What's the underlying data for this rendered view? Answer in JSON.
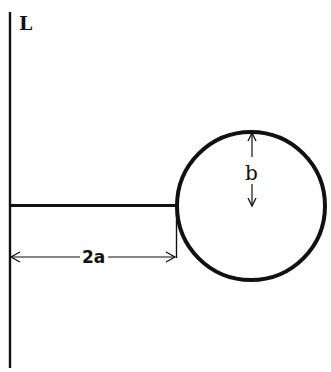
{
  "diagram": {
    "title": "",
    "labels": {
      "line": "L",
      "distance": "2a",
      "radius": "b"
    },
    "colors": {
      "stroke": "#111111",
      "background": "#ffffff"
    },
    "elements": [
      {
        "type": "vertical-line",
        "label": "L",
        "x": 10,
        "y1": 12,
        "y2": 368
      },
      {
        "type": "rod",
        "from": [
          10,
          206
        ],
        "to": [
          177,
          206
        ]
      },
      {
        "type": "circle",
        "center": [
          251,
          206
        ],
        "radius": 74
      },
      {
        "type": "dimension-arrow",
        "label": "2a",
        "from": [
          10,
          257
        ],
        "to": [
          177,
          257
        ]
      },
      {
        "type": "dimension-arrow",
        "label": "b",
        "from": [
          251,
          132
        ],
        "to": [
          251,
          206
        ]
      }
    ]
  }
}
